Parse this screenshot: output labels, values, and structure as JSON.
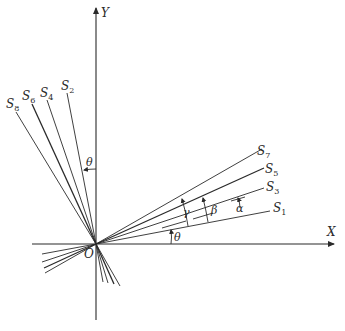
{
  "diagram": {
    "type": "geometric-construction",
    "colors": {
      "line": "#2a2a2a",
      "background": "#ffffff"
    },
    "axes": {
      "x_label": "X",
      "y_label": "Y",
      "origin_label": "O"
    },
    "lines_right": [
      {
        "name": "S",
        "sub": "1"
      },
      {
        "name": "S",
        "sub": "3"
      },
      {
        "name": "S",
        "sub": "5"
      },
      {
        "name": "S",
        "sub": "7"
      }
    ],
    "lines_left": [
      {
        "name": "S",
        "sub": "2"
      },
      {
        "name": "S",
        "sub": "4"
      },
      {
        "name": "S",
        "sub": "6"
      },
      {
        "name": "S",
        "sub": "8"
      }
    ],
    "angles": {
      "theta_x": "θ",
      "theta_y": "θ",
      "alpha": "α",
      "beta": "β",
      "gamma": "γ"
    }
  }
}
